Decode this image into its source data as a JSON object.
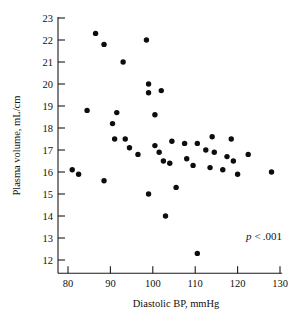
{
  "chart_data": {
    "type": "scatter",
    "title": "",
    "xlabel": "Diastolic BP, mmHg",
    "ylabel": "Plasma volume, mL/cm",
    "xlim": [
      76,
      131
    ],
    "ylim": [
      11.4,
      23
    ],
    "xticks": [
      80,
      90,
      100,
      110,
      120,
      130
    ],
    "yticks": [
      12,
      13,
      14,
      15,
      16,
      17,
      18,
      19,
      20,
      21,
      22,
      23
    ],
    "grid": false,
    "legend": false,
    "annotations": [
      {
        "text": "p < .001",
        "p_symbol": "p",
        "relation": "<",
        "value": ".001",
        "x": 122,
        "y": 12.9
      }
    ],
    "points": [
      {
        "x": 81.0,
        "y": 16.1
      },
      {
        "x": 82.5,
        "y": 15.9
      },
      {
        "x": 88.5,
        "y": 15.6
      },
      {
        "x": 86.5,
        "y": 22.3
      },
      {
        "x": 88.5,
        "y": 21.8
      },
      {
        "x": 84.5,
        "y": 18.8
      },
      {
        "x": 93.0,
        "y": 21.0
      },
      {
        "x": 91.5,
        "y": 18.7
      },
      {
        "x": 91.0,
        "y": 17.5
      },
      {
        "x": 90.5,
        "y": 18.2
      },
      {
        "x": 93.5,
        "y": 17.5
      },
      {
        "x": 94.5,
        "y": 17.1
      },
      {
        "x": 99.0,
        "y": 20.0
      },
      {
        "x": 99.0,
        "y": 19.6
      },
      {
        "x": 98.5,
        "y": 22.0
      },
      {
        "x": 102.0,
        "y": 19.7
      },
      {
        "x": 100.5,
        "y": 18.6
      },
      {
        "x": 96.5,
        "y": 16.8
      },
      {
        "x": 99.0,
        "y": 15.0
      },
      {
        "x": 100.5,
        "y": 17.2
      },
      {
        "x": 101.5,
        "y": 16.9
      },
      {
        "x": 102.5,
        "y": 16.5
      },
      {
        "x": 104.5,
        "y": 17.4
      },
      {
        "x": 104.0,
        "y": 16.4
      },
      {
        "x": 105.5,
        "y": 15.3
      },
      {
        "x": 103.0,
        "y": 14.0
      },
      {
        "x": 107.5,
        "y": 17.3
      },
      {
        "x": 108.0,
        "y": 16.6
      },
      {
        "x": 109.5,
        "y": 16.3
      },
      {
        "x": 110.5,
        "y": 17.3
      },
      {
        "x": 110.5,
        "y": 12.3
      },
      {
        "x": 112.5,
        "y": 17.0
      },
      {
        "x": 113.5,
        "y": 16.2
      },
      {
        "x": 114.0,
        "y": 17.6
      },
      {
        "x": 114.5,
        "y": 16.9
      },
      {
        "x": 116.5,
        "y": 16.1
      },
      {
        "x": 117.5,
        "y": 16.7
      },
      {
        "x": 118.5,
        "y": 17.5
      },
      {
        "x": 119.0,
        "y": 16.5
      },
      {
        "x": 120.0,
        "y": 15.9
      },
      {
        "x": 122.5,
        "y": 16.8
      },
      {
        "x": 128.0,
        "y": 16.0
      }
    ]
  }
}
